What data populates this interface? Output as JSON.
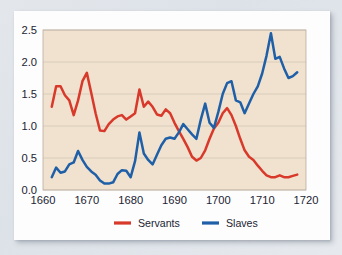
{
  "chart_data": {
    "type": "line",
    "title": "",
    "subtitle": "",
    "xlabel": "",
    "ylabel": "",
    "xlim": [
      1660,
      1720
    ],
    "ylim": [
      0.0,
      2.5
    ],
    "grid": true,
    "legend_position": "bottom",
    "xticks": [
      "1660",
      "1670",
      "1680",
      "1690",
      "1700",
      "1710",
      "1720"
    ],
    "xtick_values": [
      1660,
      1670,
      1680,
      1690,
      1700,
      1710,
      1720
    ],
    "yticks": [
      "0.0",
      "0.5",
      "1.0",
      "1.5",
      "2.0",
      "2.5"
    ],
    "ytick_values": [
      0.0,
      0.5,
      1.0,
      1.5,
      2.0,
      2.5
    ],
    "x": [
      1662,
      1663,
      1664,
      1665,
      1666,
      1667,
      1668,
      1669,
      1670,
      1671,
      1672,
      1673,
      1674,
      1675,
      1676,
      1677,
      1678,
      1679,
      1680,
      1681,
      1682,
      1683,
      1684,
      1685,
      1686,
      1687,
      1688,
      1689,
      1690,
      1691,
      1692,
      1693,
      1694,
      1695,
      1696,
      1697,
      1698,
      1699,
      1700,
      1701,
      1702,
      1703,
      1704,
      1705,
      1706,
      1707,
      1708,
      1709,
      1710,
      1711,
      1712,
      1713,
      1714,
      1715,
      1716,
      1717,
      1718
    ],
    "series": [
      {
        "name": "Servants",
        "color": "#d8392b",
        "values": [
          1.3,
          1.62,
          1.62,
          1.48,
          1.4,
          1.17,
          1.4,
          1.7,
          1.83,
          1.52,
          1.2,
          0.93,
          0.92,
          1.03,
          1.1,
          1.15,
          1.17,
          1.1,
          1.15,
          1.2,
          1.57,
          1.3,
          1.38,
          1.3,
          1.18,
          1.16,
          1.26,
          1.2,
          1.05,
          0.92,
          0.8,
          0.67,
          0.52,
          0.46,
          0.5,
          0.62,
          0.8,
          0.96,
          1.05,
          1.2,
          1.28,
          1.17,
          1.0,
          0.8,
          0.62,
          0.52,
          0.47,
          0.38,
          0.3,
          0.23,
          0.2,
          0.2,
          0.23,
          0.2,
          0.2,
          0.22,
          0.24
        ]
      },
      {
        "name": "Slaves",
        "color": "#1f5fa8",
        "values": [
          0.2,
          0.35,
          0.27,
          0.29,
          0.4,
          0.43,
          0.61,
          0.47,
          0.36,
          0.29,
          0.24,
          0.15,
          0.1,
          0.1,
          0.12,
          0.25,
          0.31,
          0.3,
          0.2,
          0.45,
          0.9,
          0.57,
          0.47,
          0.4,
          0.55,
          0.7,
          0.8,
          0.82,
          0.8,
          0.9,
          1.03,
          0.95,
          0.87,
          0.8,
          1.1,
          1.35,
          1.05,
          0.97,
          1.22,
          1.5,
          1.67,
          1.7,
          1.4,
          1.37,
          1.2,
          1.35,
          1.5,
          1.62,
          1.82,
          2.1,
          2.45,
          2.05,
          2.08,
          1.9,
          1.75,
          1.78,
          1.84
        ]
      }
    ],
    "legend": [
      {
        "label": "Servants",
        "color": "#d8392b"
      },
      {
        "label": "Slaves",
        "color": "#1f5fa8"
      }
    ],
    "style": {
      "plot_background": "#f0e2ce",
      "grid_color": "#cfc4b4",
      "frame_color": "#b9ada0",
      "card_background": "#fdfdfd",
      "page_background": "#e1e6eb",
      "tick_label_color": "#1c2433"
    }
  }
}
